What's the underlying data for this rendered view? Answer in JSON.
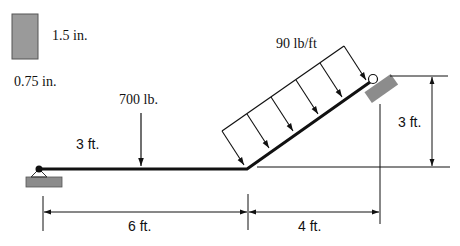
{
  "cross_section": {
    "height_label": "1.5 in.",
    "width_label": "0.75 in.",
    "fill_color": "#9a9a9a"
  },
  "loads": {
    "point_load_label": "700 lb.",
    "distributed_load_label": "90 lb/ft",
    "point_load_position_label": "3 ft."
  },
  "dimensions": {
    "horizontal_left": "6 ft.",
    "horizontal_right": "4 ft.",
    "vertical_right": "3 ft."
  },
  "colors": {
    "beam": "#111111",
    "support": "#8c8c8c"
  }
}
